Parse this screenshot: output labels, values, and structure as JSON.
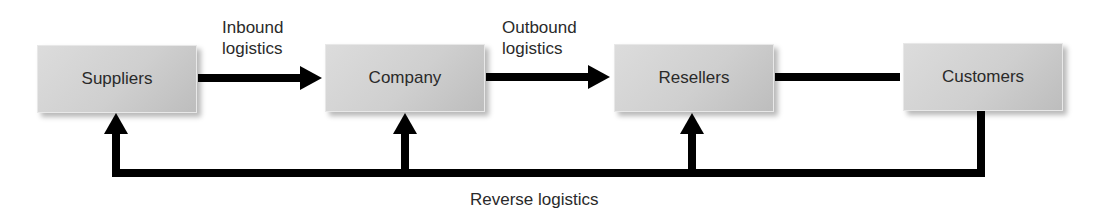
{
  "diagram": {
    "type": "flowchart",
    "nodes": [
      {
        "id": "suppliers",
        "label": "Suppliers"
      },
      {
        "id": "company",
        "label": "Company"
      },
      {
        "id": "resellers",
        "label": "Resellers"
      },
      {
        "id": "customers",
        "label": "Customers"
      }
    ],
    "edge_labels": {
      "inbound_line1": "Inbound",
      "inbound_line2": "logistics",
      "outbound_line1": "Outbound",
      "outbound_line2": "logistics",
      "reverse": "Reverse logistics"
    },
    "edges": [
      {
        "from": "suppliers",
        "to": "company",
        "label": "Inbound logistics",
        "style": "arrow"
      },
      {
        "from": "company",
        "to": "resellers",
        "label": "Outbound logistics",
        "style": "arrow"
      },
      {
        "from": "resellers",
        "to": "customers",
        "label": "",
        "style": "line"
      },
      {
        "from": "customers",
        "to": "suppliers",
        "label": "Reverse logistics",
        "style": "return-arrow"
      },
      {
        "from": "customers",
        "to": "company",
        "label": "Reverse logistics",
        "style": "return-arrow"
      },
      {
        "from": "customers",
        "to": "resellers",
        "label": "Reverse logistics",
        "style": "return-arrow"
      }
    ],
    "colors": {
      "box_fill": "#cfcfcf",
      "line": "#000000",
      "text": "#2a2a2a"
    }
  }
}
